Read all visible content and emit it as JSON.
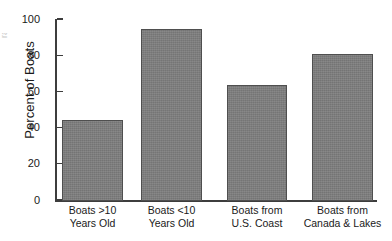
{
  "chart_data": {
    "type": "bar",
    "title": "",
    "xlabel": "",
    "ylabel": "Percent of Boats",
    "ylim": [
      0,
      100
    ],
    "yticks": [
      0,
      20,
      40,
      60,
      80,
      100
    ],
    "ytick_labels": [
      "0",
      "20",
      "40",
      "60",
      "80",
      "100"
    ],
    "grid": false,
    "legend": null,
    "orientation": "vertical",
    "bar_color": "#7d7d7d",
    "bar_edge_color": "#4f4f4f",
    "axis_color": "#3d3d3d",
    "categories": [
      "Boats >10 Years Old",
      "Boats <10 Years Old",
      "Boats from U.S. Coast",
      "Boats from Canada & Lakes"
    ],
    "category_lines": [
      [
        "Boats >10",
        "Years Old"
      ],
      [
        "Boats <10",
        "Years Old"
      ],
      [
        "Boats from",
        "U.S. Coast"
      ],
      [
        "Boats from",
        "Canada & Lakes"
      ]
    ],
    "values": [
      45,
      95,
      64,
      81
    ]
  },
  "edge_artifact": {
    "text": "rate"
  }
}
